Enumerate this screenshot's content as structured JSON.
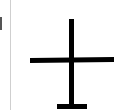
{
  "canvas": {
    "background": "#ffffff"
  },
  "left_panel": {
    "edge_mark_color": "#555555",
    "divider_color": "#cfcfcf"
  },
  "glyph": {
    "icon": "cross-with-base-icon",
    "stroke_color": "#000000"
  }
}
